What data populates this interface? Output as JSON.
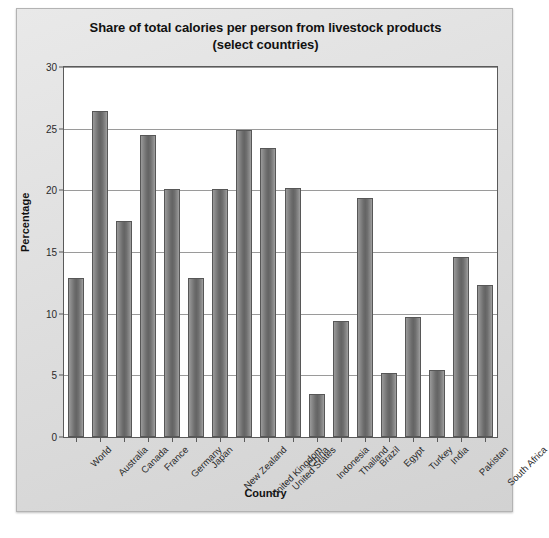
{
  "chart_data": {
    "type": "bar",
    "title": "Share of total calories per person from livestock products (select countries)",
    "title_line1": "Share of total calories per person from livestock products",
    "title_line2": "(select countries)",
    "xlabel": "Country",
    "ylabel": "Percentage",
    "ylim": [
      0,
      30
    ],
    "ytick_step": 5,
    "yticks": [
      0,
      5,
      10,
      15,
      20,
      25,
      30
    ],
    "grid": "horizontal",
    "legend": "none",
    "bar_color": "#6e6e6e",
    "categories": [
      "World",
      "Australia",
      "Canada",
      "France",
      "Germany",
      "Japan",
      "New Zealand",
      "United Kingdom",
      "United States",
      "China",
      "Indonesia",
      "Thailand",
      "Brazil",
      "Egypt",
      "Turkey",
      "India",
      "Pakistan",
      "South Africa"
    ],
    "values": [
      12.9,
      26.4,
      17.5,
      24.5,
      20.1,
      12.9,
      20.1,
      24.9,
      23.4,
      20.2,
      3.5,
      9.4,
      19.4,
      5.2,
      9.7,
      5.4,
      14.6,
      12.3
    ]
  }
}
